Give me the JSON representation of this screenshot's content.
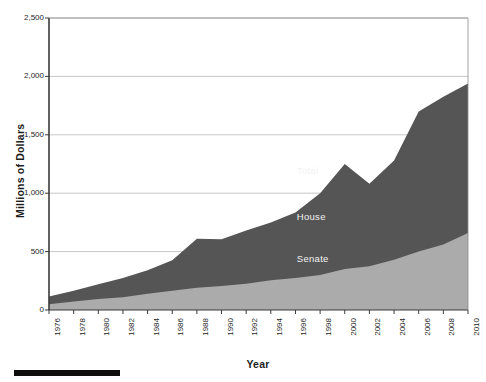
{
  "chart_data": {
    "type": "area",
    "stacked": true,
    "title": "",
    "subtitle": "",
    "xlabel": "Year",
    "ylabel": "Millions of Dollars",
    "categories": [
      1976,
      1978,
      1980,
      1982,
      1984,
      1986,
      1988,
      1990,
      1992,
      1994,
      1996,
      1998,
      2000,
      2002,
      2004,
      2006,
      2008,
      2010
    ],
    "xtick_labels": [
      "1976",
      "1978",
      "1980",
      "1982",
      "1984",
      "1986",
      "1988",
      "1990",
      "1992",
      "1994",
      "1996",
      "1998",
      "2000",
      "2002",
      "2004",
      "2006",
      "2008",
      "2010"
    ],
    "ytick_labels": [
      "0",
      "500",
      "1,000",
      "1,500",
      "2,000",
      "2,500"
    ],
    "ytick_values": [
      0,
      500,
      1000,
      1500,
      2000,
      2500
    ],
    "ylim": [
      0,
      2500
    ],
    "xlim": [
      1976,
      2010
    ],
    "grid": "horizontal",
    "legend_position": "inline-annotation",
    "series": [
      {
        "name": "Senate",
        "color": "#ababab",
        "values": [
          50,
          72,
          95,
          110,
          140,
          165,
          190,
          205,
          225,
          255,
          275,
          300,
          350,
          375,
          430,
          500,
          560,
          660
        ]
      },
      {
        "name": "House",
        "color": "#555555",
        "values": [
          65,
          93,
          125,
          165,
          200,
          260,
          420,
          400,
          455,
          495,
          560,
          700,
          900,
          705,
          850,
          1200,
          1265,
          1280
        ]
      }
    ],
    "totals": {
      "name": "Total",
      "values": [
        115,
        165,
        220,
        275,
        340,
        425,
        610,
        605,
        680,
        750,
        835,
        1000,
        1250,
        1080,
        1280,
        1700,
        1825,
        1940
      ]
    },
    "annotations": [
      {
        "text": "Total",
        "x": 2000,
        "y": 1190
      },
      {
        "text": "House",
        "x": 2000,
        "y": 800
      },
      {
        "text": "Senate",
        "x": 2000,
        "y": 440
      }
    ]
  },
  "axes": {
    "y_title": "Millions of Dollars",
    "x_title": "Year"
  },
  "colors": {
    "senate": "#ababab",
    "house": "#555555",
    "grid": "#b9b9b9",
    "axis": "#3a3a3a",
    "frame": "#8a8a8a",
    "bar": "#0d0d0d"
  },
  "decoration": {
    "bottom_rule": ""
  }
}
